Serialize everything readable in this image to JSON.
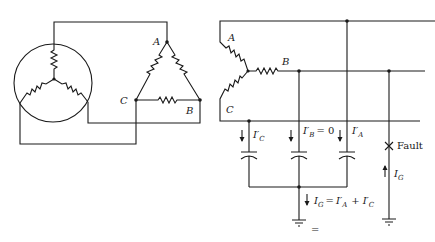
{
  "diagram": {
    "type": "circuit",
    "left_circuit": {
      "generator": "wye-connected source in circle",
      "delta_nodes": {
        "a": "A",
        "b": "B",
        "c": "C"
      }
    },
    "right_circuit": {
      "wye_nodes": {
        "a": "A",
        "b": "B",
        "c": "C"
      },
      "capacitor_currents": {
        "c": {
          "label": "I",
          "prime": "′",
          "sub": "C"
        },
        "b": {
          "label": "I",
          "prime": "′",
          "sub": "B",
          "eq": "= 0"
        },
        "a": {
          "label": "I",
          "prime": "′",
          "sub": "A"
        }
      },
      "ground_current": {
        "label": "I",
        "sub": "G",
        "equation_rhs_1": {
          "label": "I",
          "prime": "′",
          "sub": "A"
        },
        "plus": "+",
        "equation_rhs_2": {
          "label": "I",
          "prime": "′",
          "sub": "C"
        },
        "eq": "="
      },
      "fault": {
        "marker": "×",
        "label": "Fault"
      },
      "fault_current": {
        "label": "I",
        "sub": "G"
      },
      "ground_symbol_extra": "="
    },
    "colors": {
      "line": "#1a1a1a",
      "background": "#ffffff"
    }
  }
}
